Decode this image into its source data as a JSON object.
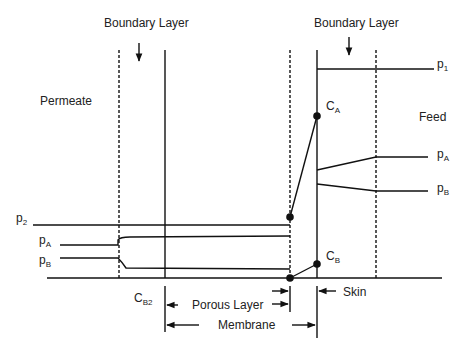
{
  "diagram": {
    "labels": {
      "boundary_layer_left": "Boundary Layer",
      "boundary_layer_right": "Boundary Layer",
      "permeate": "Permeate",
      "feed": "Feed",
      "p1": {
        "base": "p",
        "sub": "1"
      },
      "p2": {
        "base": "p",
        "sub": "2"
      },
      "pA_left": {
        "base": "p",
        "sub": "A"
      },
      "pB_left": {
        "base": "p",
        "sub": "B"
      },
      "pA_right": {
        "base": "p",
        "sub": "A"
      },
      "pB_right": {
        "base": "p",
        "sub": "B"
      },
      "CA": {
        "base": "C",
        "sub": "A"
      },
      "CB": {
        "base": "C",
        "sub": "B"
      },
      "CB2": {
        "base": "C",
        "sub": "B2"
      },
      "porous_layer": "Porous Layer",
      "membrane": "Membrane",
      "skin": "Skin"
    },
    "line_color": "#111111"
  }
}
